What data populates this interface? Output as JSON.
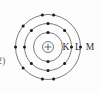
{
  "figure": {
    "question_marker": "2)",
    "background_color": "#fdfdfd",
    "line_color": "#5a5a5a",
    "electron_color": "#1a1a1a",
    "label_color": "#2b2b2b",
    "nucleus": {
      "symbol": "+",
      "name": "nucleus",
      "cx": 48,
      "cy": 47,
      "r": 5.5
    },
    "shells": [
      {
        "label": "K",
        "name": "shell-k",
        "radius": 14.5,
        "electron_count": 2,
        "electron_angles": [
          90,
          270
        ]
      },
      {
        "label": "L",
        "name": "shell-l",
        "radius": 23.5,
        "electron_count": 8,
        "electron_angles": [
          90,
          135,
          180,
          225,
          270,
          315,
          0,
          45
        ]
      },
      {
        "label": "M",
        "name": "shell-m",
        "radius": 32.5,
        "electron_count": 8,
        "electron_angles": [
          80,
          100,
          140,
          180,
          220,
          260,
          280,
          0
        ]
      }
    ],
    "shell_labels": [
      {
        "text": "K",
        "x": 66,
        "y": 50
      },
      {
        "text": "L",
        "x": 78,
        "y": 50
      },
      {
        "text": "M",
        "x": 90,
        "y": 50
      }
    ]
  }
}
